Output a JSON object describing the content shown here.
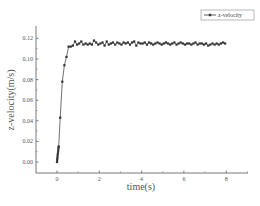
{
  "chart_data": {
    "type": "line",
    "title": "",
    "xlabel": "time(s)",
    "ylabel": "z-velocity(m/s)",
    "xlim": [
      -1,
      9
    ],
    "ylim": [
      -0.01,
      0.13
    ],
    "xticks": [
      "0",
      "2",
      "4",
      "6",
      "8"
    ],
    "yticks": [
      "0.00",
      "0.02",
      "0.04",
      "0.06",
      "0.08",
      "0.10",
      "0.12"
    ],
    "grid": false,
    "legend_position": "top-right",
    "series": [
      {
        "name": "z-velocity",
        "color": "#333333",
        "marker": "square",
        "x": [
          0.0,
          0.01,
          0.02,
          0.03,
          0.04,
          0.05,
          0.06,
          0.07,
          0.08,
          0.15,
          0.25,
          0.35,
          0.45,
          0.55,
          0.65,
          0.75,
          0.85,
          0.95,
          1.05,
          1.15,
          1.25,
          1.35,
          1.45,
          1.55,
          1.65,
          1.75,
          1.85,
          1.95,
          2.05,
          2.15,
          2.25,
          2.35,
          2.45,
          2.55,
          2.65,
          2.75,
          2.85,
          2.95,
          3.05,
          3.15,
          3.25,
          3.35,
          3.45,
          3.55,
          3.65,
          3.75,
          3.85,
          3.95,
          4.05,
          4.15,
          4.25,
          4.35,
          4.45,
          4.55,
          4.65,
          4.75,
          4.85,
          4.95,
          5.05,
          5.15,
          5.25,
          5.35,
          5.45,
          5.55,
          5.65,
          5.75,
          5.85,
          5.95,
          6.05,
          6.15,
          6.25,
          6.35,
          6.45,
          6.55,
          6.65,
          6.75,
          6.85,
          6.95,
          7.05,
          7.15,
          7.25,
          7.35,
          7.45,
          7.55,
          7.65,
          7.75,
          7.85,
          7.95
        ],
        "y": [
          0.0,
          0.002,
          0.004,
          0.006,
          0.008,
          0.01,
          0.012,
          0.014,
          0.015,
          0.043,
          0.078,
          0.094,
          0.102,
          0.112,
          0.112,
          0.113,
          0.117,
          0.114,
          0.115,
          0.117,
          0.114,
          0.115,
          0.114,
          0.115,
          0.114,
          0.118,
          0.116,
          0.114,
          0.115,
          0.116,
          0.113,
          0.117,
          0.114,
          0.115,
          0.116,
          0.114,
          0.116,
          0.115,
          0.114,
          0.116,
          0.115,
          0.116,
          0.114,
          0.116,
          0.117,
          0.113,
          0.116,
          0.115,
          0.115,
          0.116,
          0.114,
          0.116,
          0.115,
          0.114,
          0.115,
          0.116,
          0.115,
          0.114,
          0.115,
          0.116,
          0.115,
          0.114,
          0.115,
          0.116,
          0.114,
          0.115,
          0.116,
          0.115,
          0.114,
          0.115,
          0.115,
          0.114,
          0.115,
          0.116,
          0.114,
          0.115,
          0.115,
          0.114,
          0.115,
          0.113,
          0.114,
          0.115,
          0.114,
          0.115,
          0.114,
          0.115,
          0.116,
          0.115
        ]
      }
    ]
  },
  "legend": {
    "label": "z-velocity"
  },
  "axes": {
    "x_title": "time(s)",
    "y_title": "z-velocity(m/s)"
  }
}
